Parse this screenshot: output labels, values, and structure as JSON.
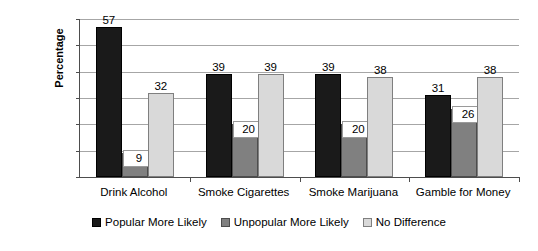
{
  "chart_data": {
    "type": "bar",
    "title": "",
    "xlabel": "",
    "ylabel": "Percentage",
    "ylim": [
      0,
      60
    ],
    "yticks": [
      0,
      10,
      20,
      30,
      40,
      50,
      60
    ],
    "ytick_labels": [
      "0",
      "10",
      "20",
      "30",
      "40",
      "50",
      "60"
    ],
    "grid": true,
    "legend_position": "bottom",
    "categories": [
      "Drink Alcohol",
      "Smoke Cigarettes",
      "Smoke Marijuana",
      "Gamble for Money"
    ],
    "series": [
      {
        "name": "Popular More Likely",
        "color": "#1a1a1a",
        "values": [
          57,
          39,
          39,
          31
        ],
        "labels": [
          "57",
          "39",
          "39",
          "31"
        ]
      },
      {
        "name": "Unpopular More Likely",
        "color": "#808080",
        "values": [
          9,
          20,
          20,
          26
        ],
        "labels": [
          "9",
          "20",
          "20",
          "26"
        ]
      },
      {
        "name": "No Difference",
        "color": "#d9d9d9",
        "values": [
          32,
          39,
          38,
          38
        ],
        "labels": [
          "32",
          "39",
          "38",
          "38"
        ]
      }
    ]
  },
  "axis": {
    "y_title": "Percentage"
  },
  "legend": {
    "items": [
      {
        "label": "Popular More Likely"
      },
      {
        "label": "Unpopular More Likely"
      },
      {
        "label": "No Difference"
      }
    ]
  }
}
